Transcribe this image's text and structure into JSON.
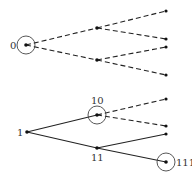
{
  "diagram": {
    "type": "binary-tree-comparison",
    "colors": {
      "line": "#222222",
      "node": "#111111",
      "circle": "#444444",
      "label": "#333333"
    },
    "top_tree": {
      "root": {
        "label": "0",
        "x": 26,
        "y": 45,
        "circled": true
      },
      "internal": [
        {
          "id": "a",
          "x": 97,
          "y": 28
        },
        {
          "id": "b",
          "x": 97,
          "y": 60
        }
      ],
      "leaves": [
        {
          "x": 166,
          "y": 11
        },
        {
          "x": 166,
          "y": 39
        },
        {
          "x": 166,
          "y": 47
        },
        {
          "x": 166,
          "y": 75
        }
      ],
      "edge_style": "dashed"
    },
    "bottom_tree": {
      "root": {
        "label": "1",
        "x": 27,
        "y": 132
      },
      "node_10": {
        "label": "10",
        "x": 97,
        "y": 115,
        "circled": true
      },
      "node_11": {
        "label": "11",
        "x": 97,
        "y": 148
      },
      "leaves": [
        {
          "x": 166,
          "y": 99,
          "style": "dashed"
        },
        {
          "x": 166,
          "y": 126,
          "style": "dashed"
        },
        {
          "x": 166,
          "y": 134,
          "style": "solid"
        },
        {
          "x": 166,
          "y": 162,
          "style": "solid",
          "label": "111",
          "circled": true
        }
      ]
    }
  },
  "labels": {
    "root_top": "0",
    "root_bottom": "1",
    "node_10": "10",
    "node_11": "11",
    "leaf_111": "111"
  }
}
